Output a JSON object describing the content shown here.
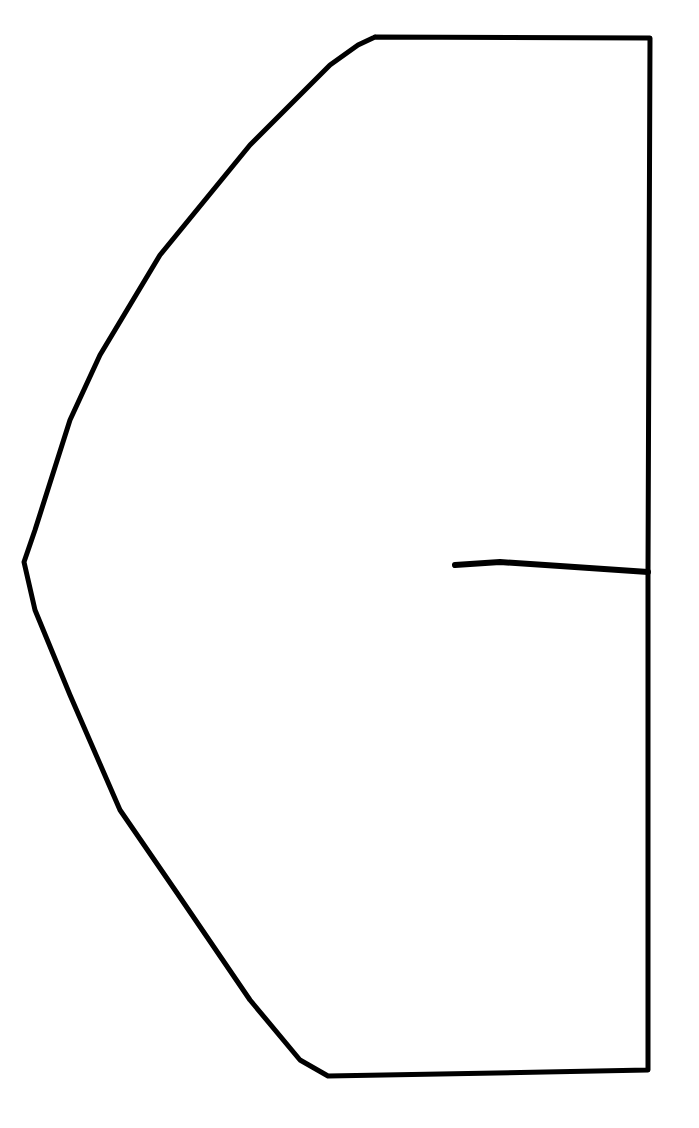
{
  "canvas": {
    "width": 699,
    "height": 1128,
    "background": "#ffffff",
    "ink": "#000000"
  },
  "drawing": {
    "description": "Hand-drawn outline of a half-shield / pattern-piece shape with a short horizontal notch line",
    "outline": {
      "stroke_width": 5,
      "points": [
        [
          375,
          37
        ],
        [
          650,
          38
        ],
        [
          649,
          300
        ],
        [
          648,
          572
        ],
        [
          648,
          900
        ],
        [
          648,
          1070
        ],
        [
          545,
          1072
        ],
        [
          328,
          1076
        ],
        [
          300,
          1060
        ],
        [
          250,
          1000
        ],
        [
          175,
          890
        ],
        [
          120,
          810
        ],
        [
          70,
          695
        ],
        [
          35,
          610
        ],
        [
          24,
          562
        ],
        [
          35,
          530
        ],
        [
          70,
          420
        ],
        [
          100,
          355
        ],
        [
          160,
          255
        ],
        [
          250,
          145
        ],
        [
          330,
          65
        ],
        [
          358,
          45
        ],
        [
          375,
          37
        ]
      ]
    },
    "notch_line": {
      "stroke_width": 6,
      "points": [
        [
          455,
          565
        ],
        [
          500,
          562
        ],
        [
          560,
          566
        ],
        [
          648,
          572
        ]
      ]
    }
  }
}
